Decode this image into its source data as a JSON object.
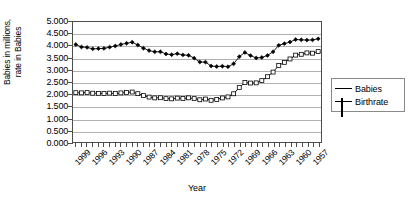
{
  "chart_data": {
    "type": "line",
    "title": "",
    "xlabel": "Year",
    "ylabel": "Babies in millions, rate in Babies",
    "ylabel_lines": [
      "Babies in millions,",
      "rate in Babies"
    ],
    "ylim": [
      0.0,
      5.0
    ],
    "ytick_step": 0.5,
    "ytick_labels": [
      "5.000",
      "4.500",
      "4.000",
      "3.500",
      "3.000",
      "2.500",
      "2.000",
      "1.500",
      "1.000",
      "0.500",
      "0.000"
    ],
    "ytick_values": [
      5.0,
      4.5,
      4.0,
      3.5,
      3.0,
      2.5,
      2.0,
      1.5,
      1.0,
      0.5,
      0.0
    ],
    "grid": true,
    "grid_axis": "y",
    "x_reversed": true,
    "legend_position": "right",
    "legend": [
      "Babies",
      "Birthrate"
    ],
    "xtick_labels": [
      "1999",
      "1996",
      "1993",
      "1990",
      "1987",
      "1984",
      "1981",
      "1978",
      "1975",
      "1972",
      "1969",
      "1966",
      "1963",
      "1960",
      "1957"
    ],
    "x": [
      2000,
      1999,
      1998,
      1997,
      1996,
      1995,
      1994,
      1993,
      1992,
      1991,
      1990,
      1989,
      1988,
      1987,
      1986,
      1985,
      1984,
      1983,
      1982,
      1981,
      1980,
      1979,
      1978,
      1977,
      1976,
      1975,
      1974,
      1973,
      1972,
      1971,
      1970,
      1969,
      1968,
      1967,
      1966,
      1965,
      1964,
      1963,
      1962,
      1961,
      1960,
      1959,
      1958,
      1957
    ],
    "series": [
      {
        "name": "Babies",
        "marker": "filled-diamond",
        "values": [
          4.059,
          3.959,
          3.942,
          3.881,
          3.891,
          3.9,
          3.953,
          4.0,
          4.065,
          4.111,
          4.158,
          4.041,
          3.91,
          3.809,
          3.757,
          3.761,
          3.669,
          3.639,
          3.681,
          3.629,
          3.612,
          3.494,
          3.333,
          3.327,
          3.168,
          3.144,
          3.16,
          3.137,
          3.258,
          3.556,
          3.731,
          3.6,
          3.502,
          3.521,
          3.606,
          3.76,
          4.027,
          4.098,
          4.167,
          4.268,
          4.258,
          4.245,
          4.255,
          4.3
        ]
      },
      {
        "name": "Birthrate",
        "marker": "open-square",
        "values": [
          2.056,
          2.048,
          2.059,
          2.033,
          2.027,
          2.019,
          2.036,
          2.02,
          2.046,
          2.062,
          2.081,
          2.014,
          1.934,
          1.872,
          1.838,
          1.844,
          1.807,
          1.799,
          1.828,
          1.812,
          1.84,
          1.808,
          1.76,
          1.79,
          1.738,
          1.774,
          1.835,
          1.879,
          2.01,
          2.267,
          2.48,
          2.456,
          2.464,
          2.558,
          2.721,
          2.913,
          3.191,
          3.319,
          3.461,
          3.62,
          3.654,
          3.713,
          3.701,
          3.767
        ]
      }
    ]
  },
  "legend": {
    "items": [
      {
        "label": "Babies",
        "marker": "filled-diamond"
      },
      {
        "label": "Birthrate",
        "marker": "open-square"
      }
    ]
  },
  "axes": {
    "x_title": "Year",
    "y_title_line1": "Babies in millions,",
    "y_title_line2": "rate in Babies"
  }
}
